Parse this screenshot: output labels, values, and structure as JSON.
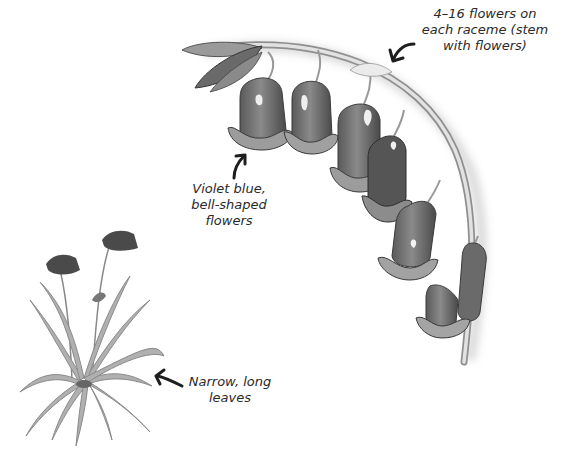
{
  "diagram": {
    "background": "#ffffff",
    "colors": {
      "petal_dark": "#4a4a4a",
      "petal_mid": "#7d7d7d",
      "petal_light": "#c9c9c9",
      "stem": "#d8d8d8",
      "stem_edge": "#8f8f8f",
      "leaf": "#a9a9a9",
      "arrow": "#1e1e1e",
      "text": "#2a2a2a"
    },
    "annotations": [
      {
        "id": "raceme",
        "lines": [
          "4–16 flowers on",
          "each raceme (stem",
          "with flowers)"
        ],
        "arrow_direction": "down-left"
      },
      {
        "id": "flowers",
        "lines": [
          "Violet blue,",
          "bell-shaped",
          "flowers"
        ],
        "arrow_direction": "up-right"
      },
      {
        "id": "leaves",
        "lines": [
          "Narrow, long",
          "leaves"
        ],
        "arrow_direction": "up-left"
      }
    ]
  }
}
